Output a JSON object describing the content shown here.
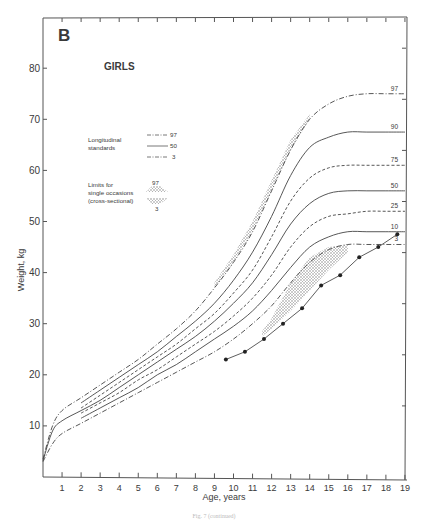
{
  "panel_letter": "B",
  "subtitle": "GIRLS",
  "caption": "Fig. 7 (continued)",
  "chart_data": {
    "type": "line",
    "title": "GIRLS",
    "panel": "B",
    "xlabel": "Age, years",
    "ylabel": "Weight, kg",
    "xlim": [
      0,
      19
    ],
    "ylim": [
      0,
      85
    ],
    "x_ticks": [
      1,
      2,
      3,
      4,
      5,
      6,
      7,
      8,
      9,
      10,
      11,
      12,
      13,
      14,
      15,
      16,
      17,
      18,
      19
    ],
    "y_ticks": [
      10,
      20,
      30,
      40,
      50,
      60,
      70,
      80
    ],
    "grid": false,
    "legend": {
      "position": "upper-left-inside",
      "longitudinal_label": "Longitudinal standards",
      "longitudinal_entries": [
        "97",
        "50",
        "3"
      ],
      "cross_sectional_label": "Limits for single occasions (cross-sectional)",
      "cross_sectional_entries": [
        "97",
        "3"
      ]
    },
    "x": [
      0,
      0.5,
      1,
      2,
      3,
      4,
      5,
      6,
      7,
      8,
      9,
      10,
      11,
      12,
      13,
      14,
      15,
      16,
      17,
      18,
      19
    ],
    "series": [
      {
        "name": "97",
        "style": "dash-dot",
        "values": [
          3.5,
          10,
          13,
          15.5,
          18,
          20.5,
          23,
          26,
          29,
          32.5,
          37,
          42,
          48,
          56,
          64,
          70,
          73,
          74.5,
          75,
          75,
          75
        ]
      },
      {
        "name": "90",
        "style": "solid",
        "values": [
          null,
          null,
          null,
          14.5,
          17,
          19.5,
          22,
          24.5,
          27.5,
          30.5,
          34,
          38.5,
          44,
          51,
          59,
          64.5,
          66.5,
          67.5,
          67.5,
          67.5,
          67.5
        ]
      },
      {
        "name": "75",
        "style": "dashed",
        "values": [
          null,
          null,
          null,
          13.5,
          16,
          18.5,
          21,
          23.5,
          26,
          29,
          32,
          36,
          40.5,
          47,
          54,
          58.5,
          60.5,
          61,
          61,
          61,
          61
        ]
      },
      {
        "name": "50",
        "style": "solid",
        "values": [
          3.2,
          9,
          11,
          13,
          15,
          17.5,
          20,
          22.5,
          25,
          27.5,
          30.5,
          34,
          38,
          43.5,
          49.5,
          53.5,
          55.5,
          56,
          56,
          56,
          56
        ]
      },
      {
        "name": "25",
        "style": "dashed",
        "values": [
          null,
          null,
          null,
          12.5,
          14.5,
          16.5,
          19,
          21,
          23.5,
          26,
          28.5,
          31.5,
          35,
          39.5,
          45,
          49,
          51,
          51.5,
          52,
          52,
          52
        ]
      },
      {
        "name": "10",
        "style": "solid",
        "values": [
          null,
          null,
          null,
          11.5,
          13.5,
          15.5,
          17.5,
          20,
          22,
          24.5,
          27,
          29.5,
          32.5,
          36.5,
          41,
          45,
          47,
          48,
          48,
          48,
          48
        ]
      },
      {
        "name": "3",
        "style": "dash-dot",
        "values": [
          3,
          6.5,
          8.5,
          10.5,
          12.5,
          14.5,
          16.5,
          18.5,
          20.5,
          22.5,
          24.5,
          27,
          30,
          33.5,
          38,
          42,
          44.5,
          45.5,
          45.5,
          45.5,
          45.5
        ]
      }
    ],
    "cross_sectional_band_97": {
      "description": "stippled band between cross-sectional 97th limit and longitudinal 97th",
      "x": [
        9,
        10,
        11,
        12,
        13,
        14
      ],
      "upper": [
        38,
        43.5,
        50,
        58,
        66,
        71
      ],
      "lower": [
        37,
        42,
        48,
        56,
        64,
        70
      ]
    },
    "cross_sectional_band_3": {
      "description": "stippled band between longitudinal 3rd and cross-sectional 3rd limit",
      "x": [
        11.5,
        12,
        13,
        14,
        15,
        16
      ],
      "upper": [
        28.5,
        31,
        38,
        43,
        45,
        45.5
      ],
      "lower": [
        27.5,
        29,
        32.5,
        36.5,
        40.5,
        44
      ]
    },
    "individual_points": {
      "name": "individual girl",
      "marker": "filled-circle",
      "x": [
        9.6,
        10.6,
        11.6,
        12.6,
        13.6,
        14.6,
        15.6,
        16.6,
        17.6,
        18.6
      ],
      "y": [
        23,
        24.5,
        27,
        30,
        33,
        37.5,
        39.5,
        43,
        45,
        47.5
      ]
    },
    "right_labels": [
      "97",
      "90",
      "75",
      "50",
      "25",
      "10",
      "3"
    ]
  }
}
